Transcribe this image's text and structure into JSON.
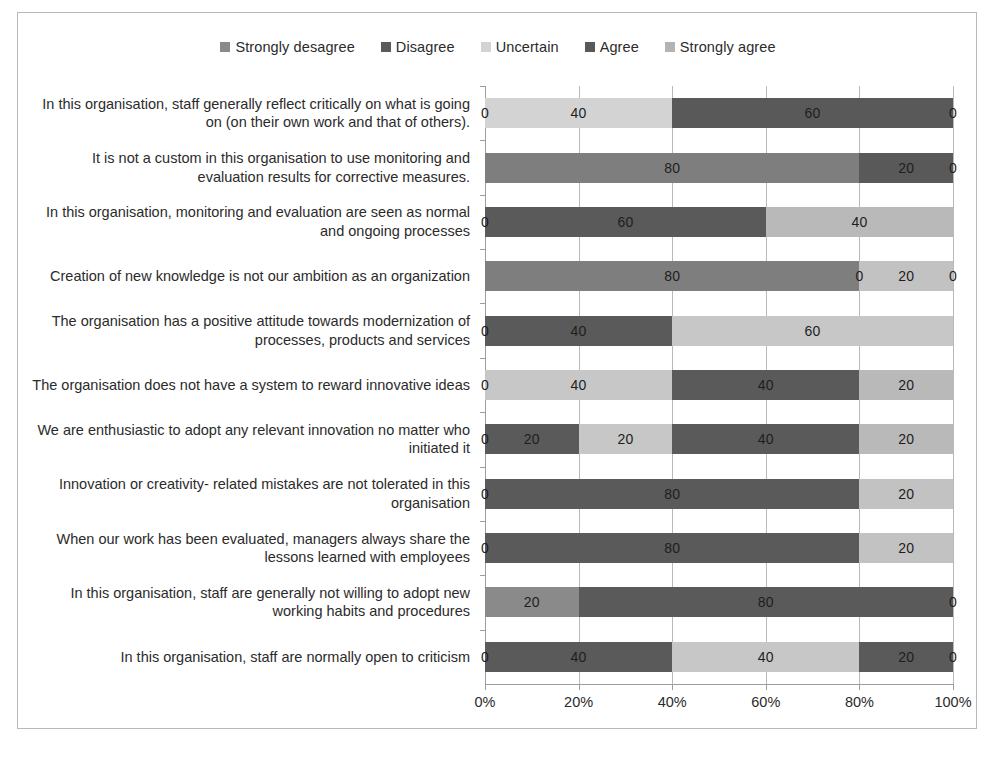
{
  "chart_data": {
    "type": "bar",
    "subtype": "stacked-horizontal-100",
    "title": "",
    "subtitle": "",
    "xlabel": "",
    "ylabel": "",
    "xlim": [
      0,
      100
    ],
    "grid": true,
    "legend_position": "top-center",
    "xticks": [
      "0%",
      "20%",
      "40%",
      "60%",
      "80%",
      "100%"
    ],
    "xtick_values": [
      0,
      20,
      40,
      60,
      80,
      100
    ],
    "legend": [
      {
        "name": "Strongly desagree",
        "color": "#8a8a8a"
      },
      {
        "name": "Disagree",
        "color": "#5a5a5a"
      },
      {
        "name": "Uncertain",
        "color": "#d3d3d3"
      },
      {
        "name": "Agree",
        "color": "#595959"
      },
      {
        "name": "Strongly agree",
        "color": "#b3b3b3"
      }
    ],
    "series": [
      {
        "name": "Strongly desagree",
        "color": "#8a8a8a",
        "values": [
          0,
          0,
          0,
          0,
          0,
          0,
          0,
          0,
          0,
          20,
          0
        ]
      },
      {
        "name": "Disagree",
        "color": "#5a5a5a",
        "values": [
          0,
          80,
          60,
          80,
          40,
          0,
          20,
          80,
          80,
          80,
          40
        ]
      },
      {
        "name": "Uncertain",
        "color": "#d3d3d3",
        "values": [
          40,
          0,
          40,
          0,
          60,
          40,
          20,
          0,
          0,
          0,
          40
        ]
      },
      {
        "name": "Agree",
        "color": "#595959",
        "values": [
          60,
          20,
          0,
          0,
          0,
          40,
          40,
          0,
          0,
          0,
          20
        ]
      },
      {
        "name": "Strongly agree",
        "color": "#b3b3b3",
        "values": [
          0,
          0,
          0,
          20,
          0,
          20,
          20,
          20,
          20,
          0,
          0
        ]
      }
    ],
    "categories": [
      "In this organisation, staff generally reflect critically on what is going on (on their own work and that of others).",
      "It is not a custom in this organisation to use monitoring and evaluation results for corrective measures.",
      "In this organisation, monitoring and evaluation are seen as normal and ongoing processes",
      "Creation of new knowledge is not our ambition as an organization",
      "The organisation has a positive attitude towards modernization of processes, products and services",
      "The organisation does not have a system to reward innovative ideas",
      "We are enthusiastic to adopt any relevant innovation no matter who initiated it",
      "Innovation or creativity- related mistakes are not tolerated in this organisation",
      "When our work has been evaluated, managers always share the lessons learned with employees",
      "In this organisation, staff are generally not willing to adopt new working habits and procedures",
      "In this organisation, staff are normally open to criticism"
    ],
    "rows": [
      {
        "segments": [
          {
            "series": "Strongly desagree",
            "value": 0,
            "color": "#8a8a8a",
            "label": "0",
            "show_label": true
          },
          {
            "series": "Disagree",
            "value": 0,
            "color": "#5a5a5a",
            "label": "",
            "show_label": false
          },
          {
            "series": "Uncertain",
            "value": 40,
            "color": "#d3d3d3",
            "label": "40",
            "show_label": true
          },
          {
            "series": "Agree",
            "value": 60,
            "color": "#595959",
            "label": "60",
            "show_label": true
          },
          {
            "series": "Strongly agree",
            "value": 0,
            "color": "#b3b3b3",
            "label": "0",
            "show_label": true
          }
        ]
      },
      {
        "segments": [
          {
            "series": "Strongly desagree",
            "value": 0,
            "color": "#8a8a8a",
            "label": "",
            "show_label": false
          },
          {
            "series": "Disagree",
            "value": 80,
            "color": "#7e7e7e",
            "label": "80",
            "show_label": true
          },
          {
            "series": "Uncertain",
            "value": 0,
            "color": "#d3d3d3",
            "label": "",
            "show_label": false
          },
          {
            "series": "Agree",
            "value": 20,
            "color": "#595959",
            "label": "20",
            "show_label": true
          },
          {
            "series": "Strongly agree",
            "value": 0,
            "color": "#b3b3b3",
            "label": "0",
            "show_label": true
          }
        ]
      },
      {
        "segments": [
          {
            "series": "Strongly desagree",
            "value": 0,
            "color": "#8a8a8a",
            "label": "0",
            "show_label": true
          },
          {
            "series": "Disagree",
            "value": 60,
            "color": "#5a5a5a",
            "label": "60",
            "show_label": true
          },
          {
            "series": "Uncertain",
            "value": 40,
            "color": "#b9b9b9",
            "label": "40",
            "show_label": true
          },
          {
            "series": "Agree",
            "value": 0,
            "color": "#595959",
            "label": "",
            "show_label": false
          },
          {
            "series": "Strongly agree",
            "value": 0,
            "color": "#b3b3b3",
            "label": "",
            "show_label": false
          }
        ]
      },
      {
        "segments": [
          {
            "series": "Strongly desagree",
            "value": 0,
            "color": "#8a8a8a",
            "label": "",
            "show_label": false
          },
          {
            "series": "Disagree",
            "value": 80,
            "color": "#7e7e7e",
            "label": "80",
            "show_label": true
          },
          {
            "series": "Uncertain",
            "value": 0,
            "color": "#d3d3d3",
            "label": "0",
            "show_label": true
          },
          {
            "series": "Agree",
            "value": 0,
            "color": "#595959",
            "label": "",
            "show_label": false
          },
          {
            "series": "Strongly agree",
            "value": 20,
            "color": "#c2c2c2",
            "label": "20",
            "show_label": true
          },
          {
            "series": "end",
            "value": 0,
            "color": "#ffffff",
            "label": "0",
            "show_label": true
          }
        ]
      },
      {
        "segments": [
          {
            "series": "Strongly desagree",
            "value": 0,
            "color": "#8a8a8a",
            "label": "0",
            "show_label": true
          },
          {
            "series": "Disagree",
            "value": 40,
            "color": "#5a5a5a",
            "label": "40",
            "show_label": true
          },
          {
            "series": "Uncertain",
            "value": 60,
            "color": "#c7c7c7",
            "label": "60",
            "show_label": true
          },
          {
            "series": "Agree",
            "value": 0,
            "color": "#595959",
            "label": "",
            "show_label": false
          },
          {
            "series": "Strongly agree",
            "value": 0,
            "color": "#b3b3b3",
            "label": "",
            "show_label": false
          }
        ]
      },
      {
        "segments": [
          {
            "series": "Strongly desagree",
            "value": 0,
            "color": "#8a8a8a",
            "label": "0",
            "show_label": true
          },
          {
            "series": "Disagree",
            "value": 0,
            "color": "#5a5a5a",
            "label": "",
            "show_label": false
          },
          {
            "series": "Uncertain",
            "value": 40,
            "color": "#c7c7c7",
            "label": "40",
            "show_label": true
          },
          {
            "series": "Agree",
            "value": 40,
            "color": "#5a5a5a",
            "label": "40",
            "show_label": true
          },
          {
            "series": "Strongly agree",
            "value": 20,
            "color": "#b9b9b9",
            "label": "20",
            "show_label": true
          }
        ]
      },
      {
        "segments": [
          {
            "series": "Strongly desagree",
            "value": 0,
            "color": "#8a8a8a",
            "label": "0",
            "show_label": true
          },
          {
            "series": "Disagree",
            "value": 20,
            "color": "#5a5a5a",
            "label": "20",
            "show_label": true
          },
          {
            "series": "Uncertain",
            "value": 20,
            "color": "#c7c7c7",
            "label": "20",
            "show_label": true
          },
          {
            "series": "Agree",
            "value": 40,
            "color": "#5a5a5a",
            "label": "40",
            "show_label": true
          },
          {
            "series": "Strongly agree",
            "value": 20,
            "color": "#b9b9b9",
            "label": "20",
            "show_label": true
          }
        ]
      },
      {
        "segments": [
          {
            "series": "Strongly desagree",
            "value": 0,
            "color": "#8a8a8a",
            "label": "0",
            "show_label": true
          },
          {
            "series": "Disagree",
            "value": 80,
            "color": "#5a5a5a",
            "label": "80",
            "show_label": true
          },
          {
            "series": "Uncertain",
            "value": 0,
            "color": "#d3d3d3",
            "label": "",
            "show_label": false
          },
          {
            "series": "Agree",
            "value": 0,
            "color": "#595959",
            "label": "",
            "show_label": false
          },
          {
            "series": "Strongly agree",
            "value": 20,
            "color": "#c2c2c2",
            "label": "20",
            "show_label": true
          }
        ]
      },
      {
        "segments": [
          {
            "series": "Strongly desagree",
            "value": 0,
            "color": "#8a8a8a",
            "label": "0",
            "show_label": true
          },
          {
            "series": "Disagree",
            "value": 80,
            "color": "#5a5a5a",
            "label": "80",
            "show_label": true
          },
          {
            "series": "Uncertain",
            "value": 0,
            "color": "#d3d3d3",
            "label": "",
            "show_label": false
          },
          {
            "series": "Agree",
            "value": 0,
            "color": "#595959",
            "label": "",
            "show_label": false
          },
          {
            "series": "Strongly agree",
            "value": 20,
            "color": "#c2c2c2",
            "label": "20",
            "show_label": true
          }
        ]
      },
      {
        "segments": [
          {
            "series": "Strongly desagree",
            "value": 20,
            "color": "#8a8a8a",
            "label": "20",
            "show_label": true
          },
          {
            "series": "Disagree",
            "value": 80,
            "color": "#5a5a5a",
            "label": "80",
            "show_label": true
          },
          {
            "series": "Uncertain",
            "value": 0,
            "color": "#d3d3d3",
            "label": "",
            "show_label": false
          },
          {
            "series": "Agree",
            "value": 0,
            "color": "#595959",
            "label": "0",
            "show_label": true
          },
          {
            "series": "Strongly agree",
            "value": 0,
            "color": "#b3b3b3",
            "label": "",
            "show_label": false
          }
        ]
      },
      {
        "segments": [
          {
            "series": "Strongly desagree",
            "value": 0,
            "color": "#8a8a8a",
            "label": "0",
            "show_label": true
          },
          {
            "series": "Disagree",
            "value": 40,
            "color": "#5a5a5a",
            "label": "40",
            "show_label": true
          },
          {
            "series": "Uncertain",
            "value": 40,
            "color": "#c7c7c7",
            "label": "40",
            "show_label": true
          },
          {
            "series": "Agree",
            "value": 20,
            "color": "#5a5a5a",
            "label": "20",
            "show_label": true
          },
          {
            "series": "Strongly agree",
            "value": 0,
            "color": "#b3b3b3",
            "label": "0",
            "show_label": true
          }
        ]
      }
    ]
  }
}
